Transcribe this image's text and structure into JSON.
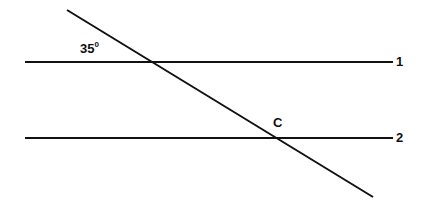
{
  "diagram": {
    "type": "parallel-lines-transversal",
    "line_color": "#111111",
    "lines": [
      {
        "id": "line-1",
        "label": "1",
        "x1": 25,
        "y1": 62,
        "x2": 393,
        "y2": 62
      },
      {
        "id": "line-2",
        "label": "2",
        "x1": 25,
        "y1": 138,
        "x2": 393,
        "y2": 138
      },
      {
        "id": "transversal",
        "label": "",
        "x1": 67,
        "y1": 10,
        "x2": 373,
        "y2": 197
      }
    ],
    "angle_label": {
      "value": "35",
      "unit": "0"
    },
    "point_label": "C",
    "line1_label": "1",
    "line2_label": "2"
  }
}
